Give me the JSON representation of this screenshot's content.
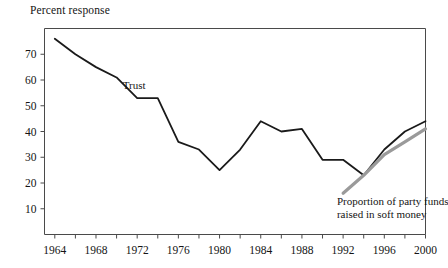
{
  "chart_data": {
    "type": "line",
    "title": "Percent response",
    "xlabel": "",
    "ylabel": "Percent response",
    "xlim": [
      1963,
      2000
    ],
    "ylim": [
      0,
      80
    ],
    "grid": false,
    "legend": "inline-annotations",
    "y_ticks": [
      10,
      20,
      30,
      40,
      50,
      60,
      70
    ],
    "y_tick_labels": [
      "10",
      "20",
      "30",
      "40",
      "50",
      "60",
      "70"
    ],
    "x_ticks": [
      1964,
      1966,
      1968,
      1970,
      1972,
      1974,
      1976,
      1978,
      1980,
      1982,
      1984,
      1986,
      1988,
      1990,
      1992,
      1994,
      1996,
      1998,
      2000
    ],
    "x_tick_labels": [
      "1964",
      "1968",
      "1972",
      "1976",
      "1980",
      "1984",
      "1988",
      "1992",
      "1996",
      "2000"
    ],
    "x_labeled_ticks": [
      1964,
      1968,
      1972,
      1976,
      1980,
      1984,
      1988,
      1992,
      1996,
      2000
    ],
    "series": [
      {
        "name": "Trust",
        "color": "#1a1a1a",
        "width": 1.8,
        "annotation": "Trust",
        "annotation_x": 1970.6,
        "annotation_y": 56.5,
        "x": [
          1964,
          1966,
          1968,
          1970,
          1972,
          1974,
          1976,
          1978,
          1980,
          1982,
          1984,
          1986,
          1988,
          1990,
          1992,
          1994,
          1996,
          1998,
          2000
        ],
        "values": [
          76,
          70,
          65,
          61,
          53,
          53,
          36,
          33,
          25,
          33,
          44,
          40,
          41,
          29,
          29,
          23,
          33,
          40,
          44
        ]
      },
      {
        "name": "Proportion of party funds raised in soft money",
        "color": "#9a9a9a",
        "width": 3.2,
        "annotation_line1": "Proportion of party funds",
        "annotation_line2": "raised in soft money",
        "annotation_x": 1991.4,
        "annotation_y": 11.5,
        "x": [
          1992,
          1994,
          1996,
          1998,
          2000
        ],
        "values": [
          16,
          23,
          31,
          36,
          41
        ]
      }
    ]
  },
  "figure": {
    "title": "Percent response"
  }
}
